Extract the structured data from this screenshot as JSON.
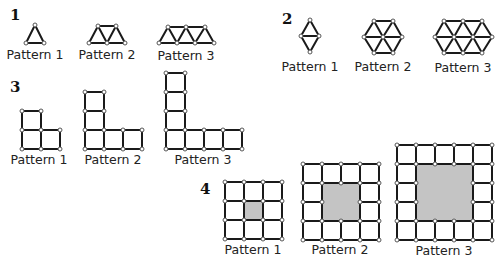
{
  "problems": [
    {
      "number": "1",
      "number_pos": [
        10,
        6
      ],
      "description": "Triangle toothpick patterns",
      "patterns": [
        {
          "label": "Pattern 1",
          "label_pos": [
            35,
            47
          ],
          "points": [
            [
              35,
              25
            ],
            [
              26,
              43
            ],
            [
              44,
              43
            ]
          ],
          "edges": [
            [
              0,
              1
            ],
            [
              0,
              2
            ],
            [
              1,
              2
            ]
          ]
        },
        {
          "label": "Pattern 2",
          "label_pos": [
            107,
            47
          ],
          "points": [
            [
              98,
              26
            ],
            [
              116,
              26
            ],
            [
              89,
              43
            ],
            [
              107,
              43
            ],
            [
              125,
              43
            ]
          ],
          "edges": [
            [
              0,
              1
            ],
            [
              2,
              3
            ],
            [
              3,
              4
            ],
            [
              0,
              2
            ],
            [
              0,
              3
            ],
            [
              1,
              3
            ],
            [
              1,
              4
            ]
          ]
        },
        {
          "label": "Pattern 3",
          "label_pos": [
            186,
            48
          ],
          "points": [
            [
              168,
              27
            ],
            [
              186,
              27
            ],
            [
              205,
              27
            ],
            [
              159,
              43
            ],
            [
              177,
              43
            ],
            [
              195,
              43
            ],
            [
              214,
              43
            ]
          ],
          "edges": [
            [
              0,
              1
            ],
            [
              1,
              2
            ],
            [
              3,
              4
            ],
            [
              4,
              5
            ],
            [
              5,
              6
            ],
            [
              0,
              3
            ],
            [
              0,
              4
            ],
            [
              1,
              4
            ],
            [
              1,
              5
            ],
            [
              2,
              5
            ],
            [
              2,
              6
            ]
          ]
        }
      ]
    },
    {
      "number": "2",
      "number_pos": [
        282,
        10
      ],
      "description": "Triangle/hexagon toothpick patterns",
      "patterns": [
        {
          "label": "Pattern 1",
          "label_pos": [
            310,
            59
          ],
          "points": [
            [
              310,
              20
            ],
            [
              301,
              36
            ],
            [
              319,
              36
            ],
            [
              310,
              52
            ]
          ],
          "edges": [
            [
              0,
              1
            ],
            [
              0,
              2
            ],
            [
              1,
              2
            ],
            [
              1,
              3
            ],
            [
              2,
              3
            ]
          ]
        },
        {
          "label": "Pattern 2",
          "label_pos": [
            383,
            59
          ],
          "points": [
            [
              374,
              21
            ],
            [
              393,
              21
            ],
            [
              364,
              37
            ],
            [
              383,
              37
            ],
            [
              402,
              37
            ],
            [
              374,
              53
            ],
            [
              393,
              53
            ]
          ],
          "edges": [
            [
              0,
              1
            ],
            [
              2,
              3
            ],
            [
              3,
              4
            ],
            [
              5,
              6
            ],
            [
              0,
              2
            ],
            [
              0,
              3
            ],
            [
              1,
              3
            ],
            [
              1,
              4
            ],
            [
              2,
              5
            ],
            [
              3,
              5
            ],
            [
              3,
              6
            ],
            [
              4,
              6
            ]
          ]
        },
        {
          "label": "Pattern 3",
          "label_pos": [
            463,
            60
          ],
          "points": [
            [
              444,
              21
            ],
            [
              463,
              21
            ],
            [
              482,
              21
            ],
            [
              435,
              37
            ],
            [
              454,
              37
            ],
            [
              473,
              37
            ],
            [
              492,
              37
            ],
            [
              444,
              53
            ],
            [
              463,
              53
            ],
            [
              482,
              53
            ]
          ],
          "edges": [
            [
              0,
              1
            ],
            [
              1,
              2
            ],
            [
              3,
              4
            ],
            [
              4,
              5
            ],
            [
              5,
              6
            ],
            [
              7,
              8
            ],
            [
              8,
              9
            ],
            [
              0,
              3
            ],
            [
              0,
              4
            ],
            [
              1,
              4
            ],
            [
              1,
              5
            ],
            [
              2,
              5
            ],
            [
              2,
              6
            ],
            [
              3,
              7
            ],
            [
              4,
              7
            ],
            [
              4,
              8
            ],
            [
              5,
              8
            ],
            [
              5,
              9
            ],
            [
              6,
              9
            ]
          ]
        }
      ]
    },
    {
      "number": "3",
      "number_pos": [
        10,
        78
      ],
      "description": "L-shaped square toothpick patterns",
      "cell": 19,
      "patterns": [
        {
          "label": "Pattern 1",
          "label_pos": [
            39,
            152
          ],
          "origin": [
            22,
            149
          ],
          "arm_up": 2,
          "arm_right": 2
        },
        {
          "label": "Pattern 2",
          "label_pos": [
            113,
            152
          ],
          "origin": [
            85,
            149
          ],
          "arm_up": 3,
          "arm_right": 3
        },
        {
          "label": "Pattern 3",
          "label_pos": [
            203,
            152
          ],
          "origin": [
            166,
            149
          ],
          "arm_up": 4,
          "arm_right": 4
        }
      ]
    },
    {
      "number": "4",
      "number_pos": [
        200,
        180
      ],
      "description": "Square frame patterns with shaded center",
      "cell": 19,
      "shade_color": "#c4c4c4",
      "patterns": [
        {
          "label": "Pattern 1",
          "label_pos": [
            253,
            242
          ],
          "origin": [
            225,
            182
          ],
          "size": 3,
          "hole": 1
        },
        {
          "label": "Pattern 2",
          "label_pos": [
            340,
            242
          ],
          "origin": [
            303,
            164
          ],
          "size": 4,
          "hole": 2
        },
        {
          "label": "Pattern 3",
          "label_pos": [
            444,
            243
          ],
          "origin": [
            397,
            145
          ],
          "size": 5,
          "hole": 3
        }
      ]
    }
  ],
  "style": {
    "stroke": "#1a1a1a",
    "stroke_width": 2,
    "node_fill": "#ffffff",
    "node_stroke": "#555555",
    "node_radius": 2
  }
}
